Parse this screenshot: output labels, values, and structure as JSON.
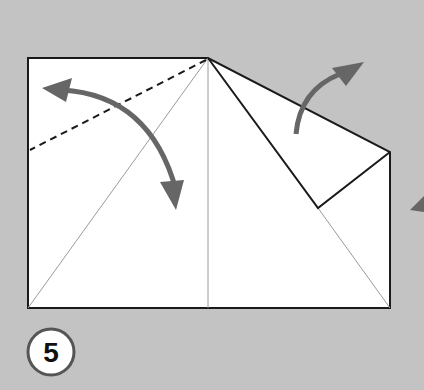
{
  "diagram": {
    "type": "origami-fold-step",
    "step_number": "5",
    "colors": {
      "background": "#c3c3c3",
      "paper": "#ffffff",
      "edge": "#1a1a1a",
      "crease": "#9a9a9a",
      "arrow": "#666666"
    },
    "elements": [
      {
        "name": "paper-left-square",
        "description": "Left square panel with diagonal crease"
      },
      {
        "name": "valley-fold-dashed-line",
        "description": "Dashed fold line from top center to left edge"
      },
      {
        "name": "double-arrow-fold-unfold",
        "description": "Curved double-headed arrow indicating fold and unfold"
      },
      {
        "name": "paper-right-panel",
        "description": "Right panel with folded flap"
      },
      {
        "name": "unfold-arrow",
        "description": "Curved arrow pointing up-right indicating flap unfolding"
      },
      {
        "name": "turn-over-arrow-partial",
        "description": "Partial arrowhead at right edge"
      },
      {
        "name": "step-number-badge",
        "description": "Circled step number"
      }
    ]
  }
}
